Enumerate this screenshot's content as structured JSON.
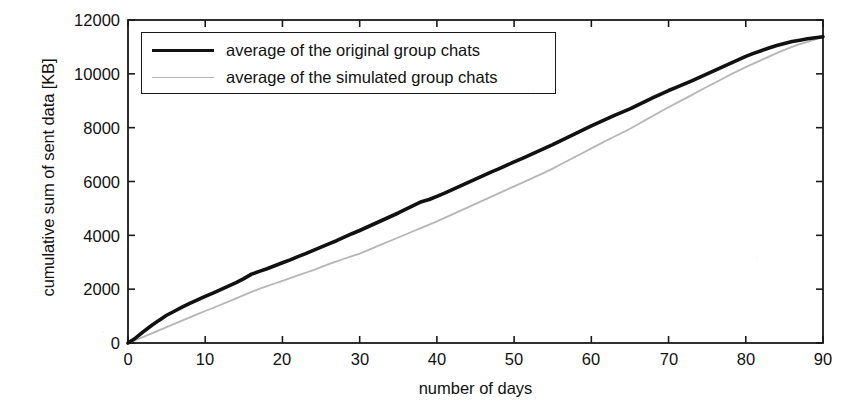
{
  "chart_data": {
    "type": "line",
    "title": "",
    "xlabel": "number of days",
    "ylabel": "cumulative sum of sent data [KB]",
    "xlim": [
      0,
      90
    ],
    "ylim": [
      0,
      12000
    ],
    "xticks": [
      0,
      10,
      20,
      30,
      40,
      50,
      60,
      70,
      80,
      90
    ],
    "yticks": [
      0,
      2000,
      4000,
      6000,
      8000,
      10000,
      12000
    ],
    "grid": false,
    "legend_position": "top-left",
    "x": [
      0,
      1,
      2,
      3,
      4,
      5,
      6,
      7,
      8,
      9,
      10,
      11,
      12,
      13,
      14,
      15,
      16,
      17,
      18,
      19,
      20,
      21,
      22,
      23,
      24,
      25,
      26,
      27,
      28,
      29,
      30,
      31,
      32,
      33,
      34,
      35,
      36,
      37,
      38,
      39,
      40,
      41,
      42,
      43,
      44,
      45,
      46,
      47,
      48,
      49,
      50,
      51,
      52,
      53,
      54,
      55,
      56,
      57,
      58,
      59,
      60,
      61,
      62,
      63,
      64,
      65,
      66,
      67,
      68,
      69,
      70,
      71,
      72,
      73,
      74,
      75,
      76,
      77,
      78,
      79,
      80,
      81,
      82,
      83,
      84,
      85,
      86,
      87,
      88,
      89,
      90
    ],
    "series": [
      {
        "name": "average of the original group chats",
        "color": "#111111",
        "width": 3.6,
        "values": [
          0,
          190,
          420,
          640,
          840,
          1030,
          1180,
          1330,
          1470,
          1600,
          1730,
          1850,
          1980,
          2110,
          2240,
          2390,
          2560,
          2660,
          2760,
          2870,
          2980,
          3090,
          3210,
          3320,
          3440,
          3560,
          3680,
          3800,
          3930,
          4060,
          4180,
          4310,
          4440,
          4570,
          4700,
          4830,
          4970,
          5110,
          5250,
          5330,
          5450,
          5570,
          5700,
          5830,
          5960,
          6090,
          6220,
          6350,
          6470,
          6600,
          6730,
          6850,
          6980,
          7110,
          7240,
          7370,
          7510,
          7650,
          7790,
          7930,
          8070,
          8200,
          8330,
          8460,
          8580,
          8700,
          8840,
          8980,
          9120,
          9250,
          9380,
          9500,
          9620,
          9740,
          9870,
          10000,
          10130,
          10260,
          10390,
          10520,
          10650,
          10760,
          10860,
          10960,
          11050,
          11130,
          11200,
          11250,
          11300,
          11340,
          11380
        ]
      },
      {
        "name": "average of the simulated group chats",
        "color": "#b6b6b6",
        "width": 1.8,
        "values": [
          0,
          110,
          230,
          350,
          470,
          590,
          710,
          830,
          950,
          1070,
          1190,
          1300,
          1420,
          1540,
          1660,
          1780,
          1900,
          2010,
          2110,
          2210,
          2310,
          2410,
          2510,
          2610,
          2710,
          2820,
          2930,
          3030,
          3130,
          3230,
          3320,
          3440,
          3560,
          3680,
          3800,
          3920,
          4040,
          4160,
          4280,
          4400,
          4520,
          4650,
          4780,
          4910,
          5040,
          5170,
          5300,
          5430,
          5560,
          5690,
          5820,
          5950,
          6080,
          6210,
          6340,
          6480,
          6630,
          6780,
          6930,
          7080,
          7230,
          7380,
          7530,
          7670,
          7810,
          7960,
          8120,
          8280,
          8440,
          8600,
          8760,
          8910,
          9060,
          9210,
          9370,
          9520,
          9670,
          9820,
          9970,
          10110,
          10250,
          10380,
          10510,
          10640,
          10770,
          10890,
          11000,
          11100,
          11190,
          11280,
          11370
        ]
      }
    ]
  },
  "axes": {
    "ylabel": "cumulative sum of sent data [KB]",
    "xlabel": "number of days",
    "ytick_labels": [
      "12000",
      "10000",
      "8000",
      "6000",
      "4000",
      "2000",
      "0"
    ],
    "xtick_labels": [
      "0",
      "10",
      "20",
      "30",
      "40",
      "50",
      "60",
      "70",
      "80",
      "90"
    ]
  },
  "legend": {
    "items": [
      {
        "label": "average of the original group chats",
        "swatch": "thick-black-line"
      },
      {
        "label": "average of the simulated group chats",
        "swatch": "thin-gray-line"
      }
    ]
  },
  "colors": {
    "original_series": "#111111",
    "simulated_series": "#b6b6b6",
    "axis": "#1a1a1a",
    "background": "#ffffff"
  }
}
